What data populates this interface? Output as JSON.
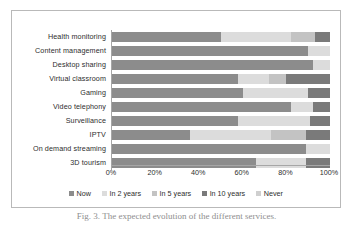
{
  "figure": {
    "caption": "Fig. 3. The expected evolution of the different services."
  },
  "legend": {
    "position": "bottom-center",
    "items": [
      {
        "label": "Now",
        "color": "#8c8c8c"
      },
      {
        "label": "In 2 years",
        "color": "#dcdcdc"
      },
      {
        "label": "In 5 years",
        "color": "#c3c3c3"
      },
      {
        "label": "In 10 years",
        "color": "#7a7a7a"
      },
      {
        "label": "Never",
        "color": "#cfcfcf"
      }
    ]
  },
  "axis": {
    "x_ticks": [
      "0%",
      "20%",
      "40%",
      "60%",
      "80%",
      "100%"
    ]
  },
  "chart_data": {
    "type": "bar",
    "orientation": "horizontal",
    "stacked": true,
    "stack_total": 100,
    "title": "",
    "xlabel": "",
    "ylabel": "",
    "xlim": [
      0,
      100
    ],
    "xticks": [
      0,
      20,
      40,
      60,
      80,
      100
    ],
    "xticklabels": [
      "0%",
      "20%",
      "40%",
      "60%",
      "80%",
      "100%"
    ],
    "grid": false,
    "legend_position": "bottom-center",
    "categories": [
      "Health monitoring",
      "Content management",
      "Desktop sharing",
      "Virtual classroom",
      "Gaming",
      "Video telephony",
      "Surveillance",
      "IPTV",
      "On demand streaming",
      "3D tourism"
    ],
    "series": [
      {
        "name": "Now",
        "color": "#8c8c8c",
        "values": [
          50,
          90,
          92,
          58,
          60,
          82,
          58,
          36,
          89,
          66
        ]
      },
      {
        "name": "In 2 years",
        "color": "#dcdcdc",
        "values": [
          32,
          10,
          8,
          14,
          30,
          10,
          33,
          37,
          11,
          23
        ]
      },
      {
        "name": "In 5 years",
        "color": "#c3c3c3",
        "values": [
          11,
          0,
          0,
          8,
          0,
          0,
          0,
          16,
          0,
          0
        ]
      },
      {
        "name": "In 10 years",
        "color": "#7a7a7a",
        "values": [
          7,
          0,
          0,
          20,
          10,
          8,
          9,
          11,
          0,
          11
        ]
      },
      {
        "name": "Never",
        "color": "#cfcfcf",
        "values": [
          0,
          0,
          0,
          0,
          0,
          0,
          0,
          0,
          0,
          0
        ]
      }
    ]
  }
}
